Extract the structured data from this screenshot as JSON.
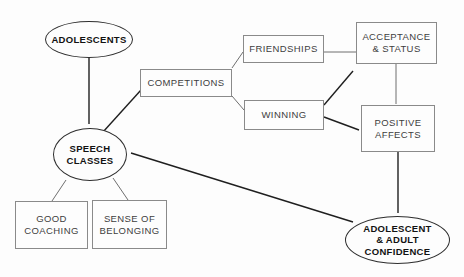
{
  "diagram": {
    "nodes": {
      "adolescents": {
        "label": "ADOLESCENTS",
        "shape": "ellipse"
      },
      "speech_classes": {
        "line1": "SPEECH",
        "line2": "CLASSES",
        "shape": "ellipse"
      },
      "good_coaching": {
        "line1": "GOOD",
        "line2": "COACHING",
        "shape": "rect"
      },
      "sense_of_belonging": {
        "line1": "SENSE OF",
        "line2": "BELONGING",
        "shape": "rect"
      },
      "competitions": {
        "label": "COMPETITIONS",
        "shape": "rect"
      },
      "friendships": {
        "label": "FRIENDSHIPS",
        "shape": "rect"
      },
      "winning": {
        "label": "WINNING",
        "shape": "rect"
      },
      "acceptance_status": {
        "line1": "ACCEPTANCE",
        "line2": "& STATUS",
        "shape": "rect"
      },
      "positive_affects": {
        "line1": "POSITIVE",
        "line2": "AFFECTS",
        "shape": "rect"
      },
      "confidence": {
        "line1": "ADOLESCENT",
        "line2": "& ADULT",
        "line3": "CONFIDENCE",
        "shape": "ellipse"
      }
    },
    "edges": [
      {
        "from": "ADOLESCENTS",
        "to": "SPEECH CLASSES",
        "type": "arrow"
      },
      {
        "from": "SPEECH CLASSES",
        "to": "COMPETITIONS",
        "type": "arrow"
      },
      {
        "from": "SPEECH CLASSES",
        "to": "GOOD COACHING",
        "type": "line"
      },
      {
        "from": "SPEECH CLASSES",
        "to": "SENSE OF BELONGING",
        "type": "line"
      },
      {
        "from": "COMPETITIONS",
        "to": "FRIENDSHIPS",
        "type": "line"
      },
      {
        "from": "COMPETITIONS",
        "to": "WINNING",
        "type": "line"
      },
      {
        "from": "FRIENDSHIPS",
        "to": "ACCEPTANCE & STATUS",
        "type": "line"
      },
      {
        "from": "WINNING",
        "to": "ACCEPTANCE & STATUS",
        "type": "arrow"
      },
      {
        "from": "WINNING",
        "to": "POSITIVE AFFECTS",
        "type": "arrow"
      },
      {
        "from": "ACCEPTANCE & STATUS",
        "to": "POSITIVE AFFECTS",
        "type": "line"
      },
      {
        "from": "POSITIVE AFFECTS",
        "to": "ADOLESCENT & ADULT CONFIDENCE",
        "type": "arrow"
      },
      {
        "from": "SPEECH CLASSES",
        "to": "ADOLESCENT & ADULT CONFIDENCE",
        "type": "double-arrow"
      }
    ],
    "colors": {
      "background": "#fdfdfd",
      "box_border": "#8a8a8a",
      "box_text": "#3d3d3d",
      "ellipse_border": "#2e2e2e",
      "ellipse_text": "#121212",
      "arrow": "#1f1f1f",
      "plain_line": "#6f6f6f"
    }
  }
}
